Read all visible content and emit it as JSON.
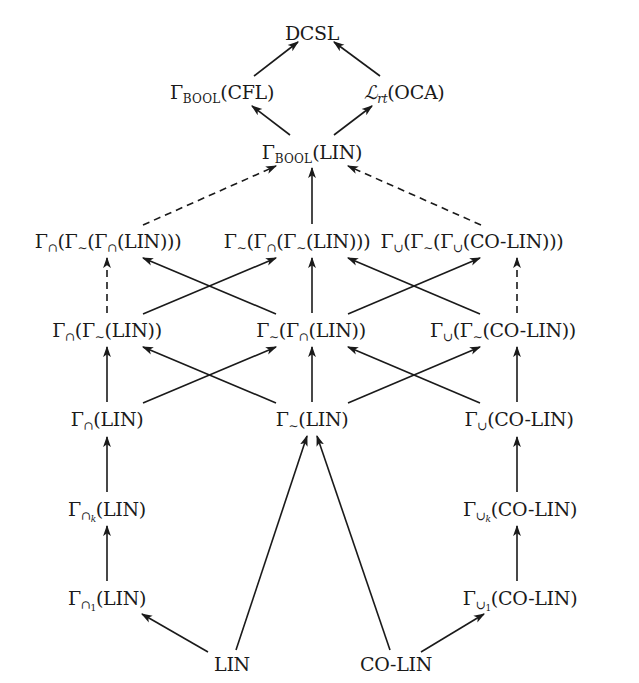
{
  "diagram": {
    "title": "",
    "nodes": [
      {
        "id": "dcsl",
        "label": "DCSL",
        "x": 312,
        "y": 33
      },
      {
        "id": "bool_cfl",
        "label": "Γ_BOOL(CFL)",
        "x": 222,
        "y": 92
      },
      {
        "id": "lrt_oca",
        "label": "ℒ_rt(OCA)",
        "x": 404,
        "y": 92
      },
      {
        "id": "bool_lin",
        "label": "Γ_BOOL(LIN)",
        "x": 312,
        "y": 152
      },
      {
        "id": "cap_neg_cap_lin",
        "label": "Γ_∩(Γ_∼(Γ_∩(LIN)))",
        "x": 108,
        "y": 241
      },
      {
        "id": "neg_cap_neg_lin",
        "label": "Γ_∼(Γ_∩(Γ_∼(LIN)))",
        "x": 297,
        "y": 241
      },
      {
        "id": "cup_neg_cup_colin",
        "label": "Γ_∪(Γ_∼(Γ_∪(CO-LIN)))",
        "x": 472,
        "y": 241
      },
      {
        "id": "cap_neg_lin",
        "label": "Γ_∩(Γ_∼(LIN))",
        "x": 107,
        "y": 330
      },
      {
        "id": "neg_cap_lin",
        "label": "Γ_∼(Γ_∩(LIN))",
        "x": 311,
        "y": 330
      },
      {
        "id": "cup_neg_colin",
        "label": "Γ_∪(Γ_∼(CO-LIN))",
        "x": 503,
        "y": 330
      },
      {
        "id": "cap_lin",
        "label": "Γ_∩(LIN)",
        "x": 107,
        "y": 419
      },
      {
        "id": "neg_lin",
        "label": "Γ_∼(LIN)",
        "x": 312,
        "y": 419
      },
      {
        "id": "cup_colin",
        "label": "Γ_∪(CO-LIN)",
        "x": 519,
        "y": 419
      },
      {
        "id": "cap_k_lin",
        "label": "Γ_∩k(LIN)",
        "x": 107,
        "y": 509
      },
      {
        "id": "cup_k_colin",
        "label": "Γ_∪k(CO-LIN)",
        "x": 520,
        "y": 509
      },
      {
        "id": "cap_1_lin",
        "label": "Γ_∩1(LIN)",
        "x": 107,
        "y": 598
      },
      {
        "id": "cup_1_colin",
        "label": "Γ_∪1(CO-LIN)",
        "x": 520,
        "y": 598
      },
      {
        "id": "lin",
        "label": "LIN",
        "x": 232,
        "y": 664
      },
      {
        "id": "colin",
        "label": "CO-LIN",
        "x": 396,
        "y": 664
      }
    ],
    "edges": [
      {
        "from": "bool_cfl",
        "to": "dcsl",
        "style": "solid",
        "x1": 254,
        "y1": 76,
        "x2": 298,
        "y2": 42
      },
      {
        "from": "lrt_oca",
        "to": "dcsl",
        "style": "solid",
        "x1": 380,
        "y1": 76,
        "x2": 334,
        "y2": 42
      },
      {
        "from": "bool_lin",
        "to": "bool_cfl",
        "style": "solid",
        "x1": 290,
        "y1": 135,
        "x2": 252,
        "y2": 106
      },
      {
        "from": "bool_lin",
        "to": "lrt_oca",
        "style": "solid",
        "x1": 334,
        "y1": 135,
        "x2": 372,
        "y2": 106
      },
      {
        "from": "cap_neg_cap_lin",
        "to": "bool_lin",
        "style": "dashed",
        "x1": 143,
        "y1": 225,
        "x2": 276,
        "y2": 166
      },
      {
        "from": "neg_cap_neg_lin",
        "to": "bool_lin",
        "style": "solid",
        "x1": 312,
        "y1": 224,
        "x2": 312,
        "y2": 168
      },
      {
        "from": "cup_neg_cup_colin",
        "to": "bool_lin",
        "style": "dashed",
        "x1": 481,
        "y1": 225,
        "x2": 348,
        "y2": 166
      },
      {
        "from": "cap_neg_lin",
        "to": "cap_neg_cap_lin",
        "style": "dashed",
        "x1": 107,
        "y1": 313,
        "x2": 107,
        "y2": 258
      },
      {
        "from": "cap_neg_lin",
        "to": "neg_cap_neg_lin",
        "style": "solid",
        "x1": 143,
        "y1": 314,
        "x2": 276,
        "y2": 258
      },
      {
        "from": "neg_cap_lin",
        "to": "cap_neg_cap_lin",
        "style": "solid",
        "x1": 276,
        "y1": 314,
        "x2": 143,
        "y2": 258
      },
      {
        "from": "neg_cap_lin",
        "to": "neg_cap_neg_lin",
        "style": "solid",
        "x1": 312,
        "y1": 313,
        "x2": 312,
        "y2": 258
      },
      {
        "from": "neg_cap_lin",
        "to": "cup_neg_cup_colin",
        "style": "solid",
        "x1": 348,
        "y1": 314,
        "x2": 480,
        "y2": 258
      },
      {
        "from": "cup_neg_colin",
        "to": "neg_cap_neg_lin",
        "style": "solid",
        "x1": 480,
        "y1": 314,
        "x2": 348,
        "y2": 258
      },
      {
        "from": "cup_neg_colin",
        "to": "cup_neg_cup_colin",
        "style": "dashed",
        "x1": 517,
        "y1": 313,
        "x2": 517,
        "y2": 258
      },
      {
        "from": "cap_lin",
        "to": "cap_neg_lin",
        "style": "solid",
        "x1": 107,
        "y1": 402,
        "x2": 107,
        "y2": 347
      },
      {
        "from": "cap_lin",
        "to": "neg_cap_lin",
        "style": "solid",
        "x1": 143,
        "y1": 403,
        "x2": 276,
        "y2": 347
      },
      {
        "from": "neg_lin",
        "to": "cap_neg_lin",
        "style": "solid",
        "x1": 276,
        "y1": 403,
        "x2": 143,
        "y2": 347
      },
      {
        "from": "neg_lin",
        "to": "neg_cap_lin",
        "style": "solid",
        "x1": 312,
        "y1": 402,
        "x2": 312,
        "y2": 347
      },
      {
        "from": "neg_lin",
        "to": "cup_neg_colin",
        "style": "solid",
        "x1": 348,
        "y1": 403,
        "x2": 480,
        "y2": 347
      },
      {
        "from": "cup_colin",
        "to": "neg_cap_lin",
        "style": "solid",
        "x1": 480,
        "y1": 403,
        "x2": 348,
        "y2": 347
      },
      {
        "from": "cup_colin",
        "to": "cup_neg_colin",
        "style": "solid",
        "x1": 517,
        "y1": 402,
        "x2": 517,
        "y2": 347
      },
      {
        "from": "cap_k_lin",
        "to": "cap_lin",
        "style": "solid",
        "x1": 107,
        "y1": 492,
        "x2": 107,
        "y2": 437
      },
      {
        "from": "cup_k_colin",
        "to": "cup_colin",
        "style": "solid",
        "x1": 517,
        "y1": 492,
        "x2": 517,
        "y2": 437
      },
      {
        "from": "cap_1_lin",
        "to": "cap_k_lin",
        "style": "solid",
        "x1": 107,
        "y1": 581,
        "x2": 107,
        "y2": 526
      },
      {
        "from": "cup_1_colin",
        "to": "cup_k_colin",
        "style": "solid",
        "x1": 517,
        "y1": 581,
        "x2": 517,
        "y2": 526
      },
      {
        "from": "lin",
        "to": "cap_1_lin",
        "style": "solid",
        "x1": 208,
        "y1": 652,
        "x2": 142,
        "y2": 614
      },
      {
        "from": "lin",
        "to": "neg_lin",
        "style": "solid",
        "x1": 236,
        "y1": 650,
        "x2": 307,
        "y2": 436
      },
      {
        "from": "colin",
        "to": "neg_lin",
        "style": "solid",
        "x1": 390,
        "y1": 650,
        "x2": 317,
        "y2": 436
      },
      {
        "from": "colin",
        "to": "cup_1_colin",
        "style": "solid",
        "x1": 421,
        "y1": 652,
        "x2": 484,
        "y2": 614
      }
    ]
  },
  "labels": {
    "dcsl": "DCSL",
    "gamma": "Γ",
    "bool": "BOOL",
    "cfl": "(CFL)",
    "script_l": "ℒ",
    "rt": "rt",
    "oca": "(OCA)",
    "lin_paren": "(LIN)",
    "colin_paren": "(CO-LIN)",
    "cap": "∩",
    "cup": "∪",
    "neg": "∼",
    "k": "k",
    "one": "1",
    "open": "(",
    "close1": ")",
    "close2": "))",
    "close3": ")))",
    "lin": "LIN",
    "colin": "CO-LIN"
  },
  "colors": {
    "ink": "#1a1a1a",
    "background": "#ffffff"
  }
}
